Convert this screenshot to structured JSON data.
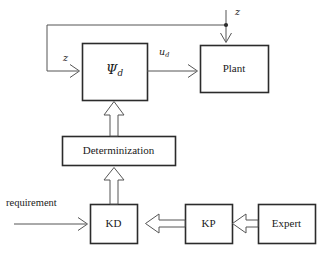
{
  "diagram": {
    "background_color": "#ffffff",
    "line_color": "#2b2b2b",
    "arrow_fill": "#ffffff",
    "nodes": [
      {
        "id": "psi_d",
        "label": "Ψ",
        "subscript": "d",
        "x": 82,
        "y": 43,
        "w": 65,
        "h": 57
      },
      {
        "id": "plant",
        "label": "Plant",
        "subscript": "",
        "x": 200,
        "y": 45,
        "w": 68,
        "h": 47
      },
      {
        "id": "determinization",
        "label": "Determinization",
        "subscript": "",
        "x": 62,
        "y": 136,
        "w": 113,
        "h": 29
      },
      {
        "id": "kd",
        "label": "KD",
        "subscript": "",
        "x": 90,
        "y": 204,
        "w": 47,
        "h": 39
      },
      {
        "id": "kp",
        "label": "KP",
        "subscript": "",
        "x": 185,
        "y": 204,
        "w": 47,
        "h": 39
      },
      {
        "id": "expert",
        "label": "Expert",
        "subscript": "",
        "x": 258,
        "y": 204,
        "w": 57,
        "h": 39
      }
    ],
    "edge_labels": [
      {
        "id": "z-top",
        "text": "z",
        "subscript": "",
        "italic": true,
        "x": 235,
        "y": 8,
        "from": "external",
        "to": "plant"
      },
      {
        "id": "z-feedback",
        "text": "z",
        "subscript": "",
        "italic": true,
        "x": 63,
        "y": 53,
        "from": "plant",
        "to": "psi_d"
      },
      {
        "id": "u-d",
        "text": "u",
        "subscript": "d",
        "italic": true,
        "x": 159,
        "y": 48,
        "from": "psi_d",
        "to": "plant"
      },
      {
        "id": "requirement",
        "text": "requirement",
        "subscript": "",
        "italic": false,
        "x": 6,
        "y": 199,
        "from": "external",
        "to": "kd"
      }
    ],
    "edges": [
      {
        "id": "psi-to-plant",
        "style": "thin-line",
        "head": "open-v",
        "direction": "right"
      },
      {
        "id": "z-into-plant",
        "style": "thin-line",
        "head": "open-v",
        "direction": "down"
      },
      {
        "id": "plant-feedback",
        "style": "thin-line",
        "head": "open-v",
        "direction": "right"
      },
      {
        "id": "req-to-kd",
        "style": "thin-line",
        "head": "open-v",
        "direction": "right"
      },
      {
        "id": "kd-to-determ",
        "style": "block-arrow",
        "head": "hollow",
        "direction": "up"
      },
      {
        "id": "determ-to-psi",
        "style": "block-arrow",
        "head": "hollow",
        "direction": "up"
      },
      {
        "id": "kp-to-kd",
        "style": "block-arrow",
        "head": "hollow",
        "direction": "left"
      },
      {
        "id": "expert-to-kp",
        "style": "block-arrow",
        "head": "hollow",
        "direction": "left"
      }
    ],
    "junctions": [
      {
        "id": "feedback-tap",
        "x": 226,
        "y": 25
      }
    ]
  }
}
